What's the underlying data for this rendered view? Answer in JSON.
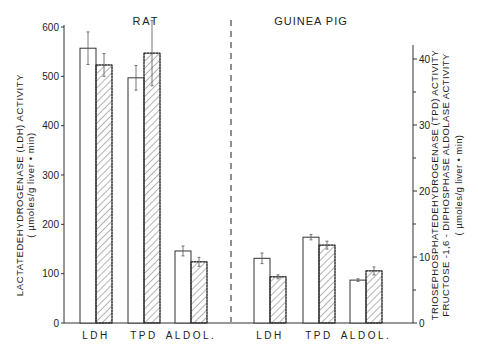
{
  "chart_data": {
    "type": "bar",
    "title": "",
    "panels": [
      {
        "name": "RAT",
        "axis": "left",
        "categories": [
          "LDH",
          "TPD",
          "ALDOL."
        ],
        "series": [
          {
            "name": "open",
            "pattern": "none",
            "values": [
              557,
              497,
              146
            ],
            "errors": [
              33,
              25,
              10
            ]
          },
          {
            "name": "hatched",
            "pattern": "hatched",
            "values": [
              523,
              547,
              124
            ],
            "errors": [
              23,
              66,
              9
            ]
          }
        ]
      },
      {
        "name": "GUINEA PIG",
        "axis": "right",
        "categories": [
          "LDH",
          "TPD",
          "ALDOL."
        ],
        "series": [
          {
            "name": "open",
            "pattern": "none",
            "values": [
              9.8,
              13.0,
              6.5
            ],
            "errors": [
              0.8,
              0.4,
              0.2
            ]
          },
          {
            "name": "hatched",
            "pattern": "hatched",
            "values": [
              7.0,
              11.8,
              7.9
            ],
            "errors": [
              0.3,
              0.6,
              0.6
            ]
          }
        ]
      }
    ],
    "left_axis": {
      "label_line1": "LACTATEDEHYDROGENASE (LDH) ACTIVITY",
      "label_line2": "( µmoles/g liver • min)",
      "ylim": [
        0,
        600
      ],
      "ticks": [
        0,
        100,
        200,
        300,
        400,
        500,
        600
      ]
    },
    "right_axis": {
      "label_line1": "TRIOSEPHOSPHATEDEHYDROGENASE (TPD) ACTIVITY",
      "label_line2": "FRUCTOSE -1,6 - DIPHOSPHASE  ALDOLASE  ACTIVITY",
      "label_line3": "( µmoles/g liver • min)",
      "ylim": [
        0,
        40
      ],
      "ticks": [
        0,
        10,
        20,
        30,
        40
      ],
      "minor_ticks": [
        5,
        15,
        25,
        35
      ]
    },
    "grid": false,
    "legend": null,
    "divider": "dashed vertical line between RAT and GUINEA PIG panels"
  }
}
